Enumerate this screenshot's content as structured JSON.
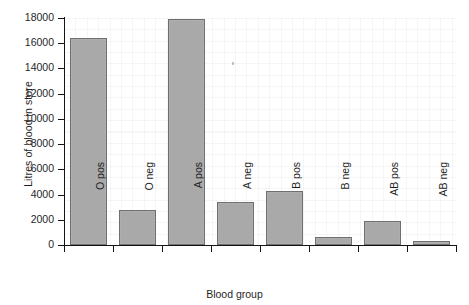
{
  "chart_data": {
    "type": "bar",
    "title": "",
    "xlabel": "Blood group",
    "ylabel": "Litres of blood in store",
    "categories": [
      "O pos",
      "O neg",
      "A pos",
      "A neg",
      "B pos",
      "B neg",
      "AB pos",
      "AB neg"
    ],
    "values": [
      16400,
      2750,
      17950,
      3400,
      4250,
      650,
      1900,
      300
    ],
    "ylim": [
      0,
      18000
    ],
    "ytick_values": [
      0,
      2000,
      4000,
      6000,
      8000,
      10000,
      12000,
      14000,
      16000,
      18000
    ],
    "ytick_labels": [
      "0",
      "2000",
      "4000",
      "6000",
      "8000",
      "10000",
      "12000",
      "14000",
      "16000",
      "18000"
    ],
    "grid": "faint-background-graph-paper",
    "legend": null,
    "orientation": "vertical",
    "bar_color": "#a9a9a9",
    "bar_edge_color": "#6f6f6f",
    "axis_color": "#141414",
    "background_color": "#ffffff",
    "xtick_label_rotation": 90
  }
}
